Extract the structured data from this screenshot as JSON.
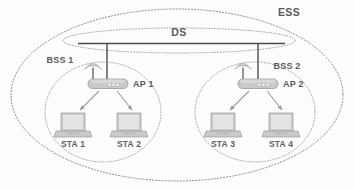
{
  "diagram": {
    "title": "ESS",
    "type": "network-topology",
    "background_color": "#fdfdfd",
    "stroke_color": "#8a8a8a",
    "text_color": "#5a5a5a",
    "device_fill": "#c9c9c9"
  },
  "labels": {
    "ess": "ESS",
    "ds": "DS",
    "bss1": "BSS 1",
    "bss2": "BSS 2",
    "ap1": "AP 1",
    "ap2": "AP 2",
    "sta1": "STA 1",
    "sta2": "STA 2",
    "sta3": "STA 3",
    "sta4": "STA 4"
  },
  "regions": [
    {
      "id": "ess",
      "label": "ESS",
      "shape": "ellipse",
      "style": "dotted"
    },
    {
      "id": "ds",
      "label": "DS",
      "shape": "ellipse",
      "style": "dotted"
    },
    {
      "id": "bss1",
      "label": "BSS 1",
      "shape": "ellipse",
      "style": "dotted"
    },
    {
      "id": "bss2",
      "label": "BSS 2",
      "shape": "ellipse",
      "style": "dotted"
    }
  ],
  "nodes": [
    {
      "id": "ap1",
      "label": "AP 1",
      "type": "access-point",
      "parent": "bss1"
    },
    {
      "id": "ap2",
      "label": "AP 2",
      "type": "access-point",
      "parent": "bss2"
    },
    {
      "id": "sta1",
      "label": "STA 1",
      "type": "station-laptop",
      "parent": "bss1"
    },
    {
      "id": "sta2",
      "label": "STA 2",
      "type": "station-laptop",
      "parent": "bss1"
    },
    {
      "id": "sta3",
      "label": "STA 3",
      "type": "station-laptop",
      "parent": "bss2"
    },
    {
      "id": "sta4",
      "label": "STA 4",
      "type": "station-laptop",
      "parent": "bss2"
    }
  ],
  "links": [
    {
      "from": "ds",
      "to": "ap1",
      "style": "solid"
    },
    {
      "from": "ds",
      "to": "ap2",
      "style": "solid"
    },
    {
      "from": "ap1",
      "to": "sta1",
      "style": "arrow"
    },
    {
      "from": "ap1",
      "to": "sta2",
      "style": "arrow"
    },
    {
      "from": "ap2",
      "to": "sta3",
      "style": "arrow"
    },
    {
      "from": "ap2",
      "to": "sta4",
      "style": "arrow"
    }
  ]
}
